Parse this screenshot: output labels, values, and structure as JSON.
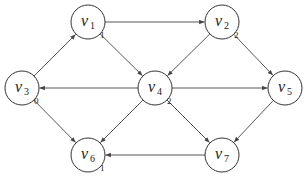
{
  "diagram": {
    "type": "directed-graph",
    "node_radius": 17,
    "colors": {
      "stroke": "#333333",
      "edge": "#444444",
      "fill": "#ffffff",
      "text": "#222222"
    },
    "nodes": [
      {
        "id": "v1",
        "base": "v",
        "sub": "1",
        "x": 88,
        "y": 22,
        "tag": "1"
      },
      {
        "id": "v2",
        "base": "v",
        "sub": "2",
        "x": 222,
        "y": 22,
        "tag": "2"
      },
      {
        "id": "v3",
        "base": "v",
        "sub": "3",
        "x": 22,
        "y": 88,
        "tag": "0"
      },
      {
        "id": "v4",
        "base": "v",
        "sub": "4",
        "x": 155,
        "y": 88,
        "tag": "2"
      },
      {
        "id": "v5",
        "base": "v",
        "sub": "5",
        "x": 285,
        "y": 88,
        "tag": ""
      },
      {
        "id": "v6",
        "base": "v",
        "sub": "6",
        "x": 88,
        "y": 155,
        "tag": "1"
      },
      {
        "id": "v7",
        "base": "v",
        "sub": "7",
        "x": 222,
        "y": 155,
        "tag": ""
      }
    ],
    "edges": [
      {
        "from": "v1",
        "to": "v2"
      },
      {
        "from": "v1",
        "to": "v4"
      },
      {
        "from": "v2",
        "to": "v4"
      },
      {
        "from": "v2",
        "to": "v5"
      },
      {
        "from": "v3",
        "to": "v1"
      },
      {
        "from": "v3",
        "to": "v6"
      },
      {
        "from": "v4",
        "to": "v3"
      },
      {
        "from": "v4",
        "to": "v5"
      },
      {
        "from": "v4",
        "to": "v6"
      },
      {
        "from": "v4",
        "to": "v7"
      },
      {
        "from": "v5",
        "to": "v7"
      },
      {
        "from": "v7",
        "to": "v6"
      }
    ]
  }
}
